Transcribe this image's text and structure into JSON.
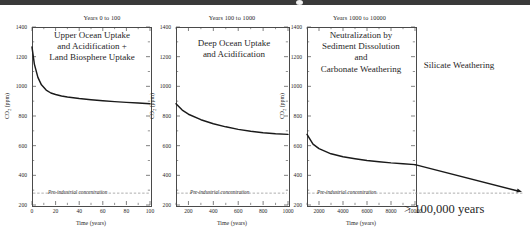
{
  "chart_data": [
    {
      "type": "line",
      "title": "Years 0 to 100",
      "annotation": "Upper Ocean Uptake and Acidification + Land Biosphere Uptake",
      "xlabel": "Time (years)",
      "ylabel": "CO2 (ppm)",
      "xlim": [
        0,
        100
      ],
      "ylim": [
        200,
        1400
      ],
      "xticks": [
        0,
        20,
        40,
        60,
        80,
        100
      ],
      "yticks": [
        200,
        400,
        600,
        800,
        1000,
        1200,
        1400
      ],
      "grid": false,
      "reference_line": {
        "label": "Pre-industrial concentration",
        "value": 280,
        "style": "dashed"
      },
      "x": [
        0,
        2,
        5,
        8,
        12,
        16,
        20,
        25,
        30,
        40,
        50,
        60,
        70,
        80,
        90,
        100
      ],
      "y": [
        1265,
        1150,
        1060,
        1010,
        975,
        955,
        945,
        935,
        928,
        918,
        910,
        903,
        897,
        892,
        887,
        882
      ]
    },
    {
      "type": "line",
      "title": "Years 100 to 1000",
      "annotation": "Deep Ocean Uptake and Acidification",
      "xlabel": "Time (years)",
      "ylabel": "CO2 (ppm)",
      "xlim": [
        100,
        1000
      ],
      "ylim": [
        200,
        1400
      ],
      "xticks": [
        200,
        400,
        600,
        800,
        1000
      ],
      "yticks": [
        200,
        400,
        600,
        800,
        1000,
        1200,
        1400
      ],
      "grid": false,
      "reference_line": {
        "label": "Pre-industrial concentration",
        "value": 280,
        "style": "dashed"
      },
      "x": [
        100,
        150,
        200,
        300,
        400,
        500,
        600,
        700,
        800,
        900,
        1000
      ],
      "y": [
        882,
        840,
        812,
        775,
        748,
        727,
        710,
        697,
        687,
        680,
        676
      ]
    },
    {
      "type": "line",
      "title": "Years 1000 to 10000",
      "annotation": "Neutralization by Sediment Dissolution and Carbonate Weathering",
      "xlabel": "Time (years)",
      "ylabel": "CO2 (ppm)",
      "xlim": [
        1000,
        10000
      ],
      "ylim": [
        200,
        1400
      ],
      "xticks": [
        2000,
        4000,
        6000,
        8000,
        10000
      ],
      "yticks": [
        200,
        400,
        600,
        800,
        1000,
        1200,
        1400
      ],
      "grid": false,
      "reference_line": {
        "label": "Pre-industrial concentration",
        "value": 280,
        "style": "dashed"
      },
      "x": [
        1000,
        1500,
        2000,
        3000,
        4000,
        5000,
        6000,
        7000,
        8000,
        9000,
        10000
      ],
      "y": [
        676,
        610,
        580,
        545,
        525,
        512,
        500,
        492,
        484,
        478,
        472
      ],
      "extension": {
        "label": "Silicate Weathering",
        "duration_label": "> 100,000 years",
        "start_value": 472,
        "end_value": 285,
        "style": "arrow"
      }
    }
  ],
  "panels": [
    {
      "id": "panel-1",
      "title": "Years 0 to 100",
      "annotation_lines": [
        "Upper Ocean Uptake",
        "and Acidification +",
        "Land Biosphere Uptake"
      ],
      "xlabel": "Time (years)",
      "ylabel": "CO",
      "ylabel_sub": "2",
      "ylabel_unit": " (ppm)",
      "xticks": [
        "0",
        "20",
        "40",
        "60",
        "80",
        "100"
      ],
      "yticks": [
        "1400",
        "1200",
        "1000",
        "800",
        "600",
        "400",
        "200"
      ],
      "preindustrial_label": "Pre-industrial concentration"
    },
    {
      "id": "panel-2",
      "title": "Years 100 to 1000",
      "annotation_lines": [
        "Deep Ocean Uptake",
        "and Acidification"
      ],
      "xlabel": "Time (years)",
      "ylabel": "CO",
      "ylabel_sub": "2",
      "ylabel_unit": " (ppm)",
      "xticks": [
        "200",
        "400",
        "600",
        "800",
        "1000"
      ],
      "yticks": [
        "1400",
        "1200",
        "1000",
        "800",
        "600",
        "400",
        "200"
      ],
      "preindustrial_label": "Pre-industrial concentration"
    },
    {
      "id": "panel-3",
      "title": "Years 1000 to 10000",
      "annotation_lines": [
        "Neutralization by",
        "Sediment Dissolution",
        "and",
        "Carbonate Weathering"
      ],
      "xlabel": "Time (years)",
      "ylabel": "CO",
      "ylabel_sub": "2",
      "ylabel_unit": " (ppm)",
      "xticks": [
        "2000",
        "4000",
        "6000",
        "8000",
        "10000"
      ],
      "yticks": [
        "1400",
        "1200",
        "1000",
        "800",
        "600",
        "400",
        "200"
      ],
      "preindustrial_label": "Pre-industrial concentration"
    }
  ],
  "extension": {
    "silicate_label": "Silicate Weathering",
    "duration_label": "> 100,000 years"
  },
  "colors": {
    "curve": "#1a1a1a",
    "axis": "#4a4a4a",
    "text": "#262626",
    "dashed": "#8a8a8a",
    "topbar": "#3a3a3a"
  }
}
